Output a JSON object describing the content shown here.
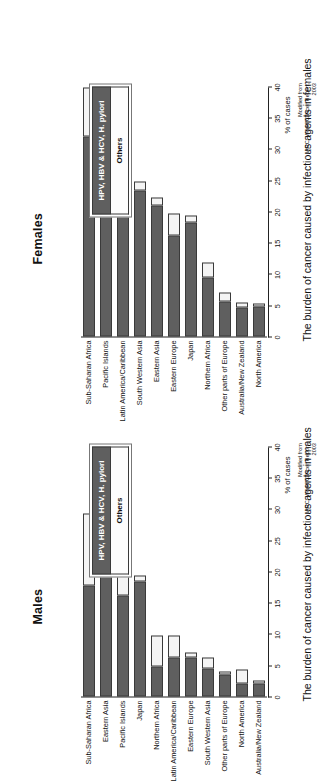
{
  "figure": {
    "legend": {
      "infectious_label": "HPV, HBV & HCV, H. pylori",
      "others_label": "Others"
    },
    "source_line1": "Modified from",
    "source_line2": "IARC: World Cancer Report,",
    "source_line3": "2003",
    "axis_label": "% of cases",
    "colors": {
      "infectious": "#5f5f5f",
      "others": "#f4f4f4",
      "axis": "#222222",
      "text": "#111111"
    }
  },
  "chart_data": [
    {
      "type": "bar",
      "orientation": "horizontal-stacked",
      "title": "Males",
      "caption": "The burden of cancer caused by infectious agents in males",
      "xlabel": "% of cases",
      "ylabel": "",
      "xlim": [
        0,
        40
      ],
      "xticks": [
        0,
        5,
        10,
        15,
        20,
        25,
        30,
        35,
        40
      ],
      "grid": false,
      "legend_position": "right",
      "categories": [
        "Sub-Saharan Africa",
        "Eastern Asia",
        "Pacific Islands",
        "Japan",
        "Northern Africa",
        "Latin America/Caribbean",
        "Eastern Europe",
        "South Western Asia",
        "Other parts of Europe",
        "North America",
        "Australia/New Zealand"
      ],
      "series": [
        {
          "name": "HPV, HBV & HCV, H. pylori",
          "values": [
            17.8,
            21.0,
            16.2,
            18.4,
            4.8,
            6.2,
            6.3,
            4.5,
            3.5,
            2.0,
            2.1
          ]
        },
        {
          "name": "Others",
          "values": [
            11.4,
            1.6,
            6.6,
            1.0,
            5.0,
            3.6,
            0.7,
            1.8,
            0.5,
            2.3,
            0.5
          ]
        }
      ],
      "totals": [
        29.2,
        22.6,
        22.8,
        19.4,
        9.8,
        9.8,
        7.0,
        6.3,
        4.0,
        4.3,
        2.6
      ]
    },
    {
      "type": "bar",
      "orientation": "horizontal-stacked",
      "title": "Females",
      "caption": "The burden of cancer caused by infectious agents in females",
      "xlabel": "% of cases",
      "ylabel": "",
      "xlim": [
        0,
        40
      ],
      "xticks": [
        0,
        5,
        10,
        15,
        20,
        25,
        30,
        35,
        40
      ],
      "grid": false,
      "legend_position": "right",
      "categories": [
        "Sub-Saharan Africa",
        "Pacific Islands",
        "Latin America/Caribbean",
        "South Western Asia",
        "Eastern Asia",
        "Eastern Europe",
        "Japan",
        "Northern Africa",
        "Other parts of Europe",
        "Australia/New Zealand",
        "North America"
      ],
      "series": [
        {
          "name": "HPV, HBV & HCV, H. pylori",
          "values": [
            32.0,
            30.0,
            23.3,
            23.4,
            21.0,
            16.2,
            18.2,
            9.5,
            5.6,
            4.7,
            4.8
          ]
        },
        {
          "name": "Others",
          "values": [
            7.9,
            2.3,
            2.1,
            1.4,
            1.3,
            3.4,
            1.2,
            2.4,
            1.4,
            0.8,
            0.5
          ]
        }
      ],
      "totals": [
        39.9,
        32.3,
        25.4,
        24.8,
        22.3,
        19.6,
        19.4,
        11.9,
        7.0,
        5.5,
        5.3
      ]
    }
  ]
}
